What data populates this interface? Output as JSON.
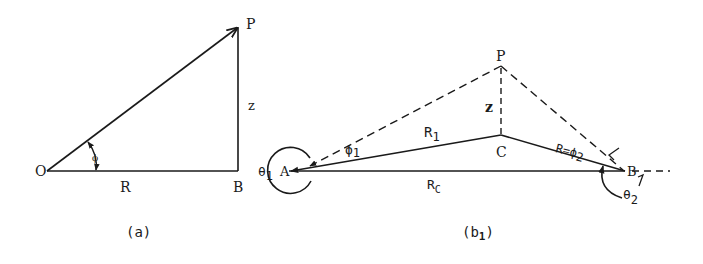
{
  "diagram_a": {
    "caption": "(a)",
    "points": {
      "O": "O",
      "B": "B",
      "P": "P"
    },
    "labels": {
      "base": "R",
      "height": "z",
      "angle": "ϕ"
    }
  },
  "diagram_b1": {
    "caption_main": "(b",
    "caption_sub": "1",
    "caption_close": ")",
    "points": {
      "A": "A",
      "B": "B",
      "C": "C",
      "P": "P"
    },
    "labels": {
      "R1_main": "R",
      "R1_sub": "1",
      "Rc_main": "R",
      "Rc_sub": "C",
      "z": "z",
      "phi1_main": "ϕ",
      "phi1_sub": "1",
      "R2_label": "R=ϕ",
      "R2_sub": "2",
      "theta1_main": "θ",
      "theta1_sub": "1",
      "theta2_main": "θ",
      "theta2_sub": "2"
    }
  },
  "colors": {
    "line": "#1a1a1a",
    "background": "#ffffff"
  }
}
